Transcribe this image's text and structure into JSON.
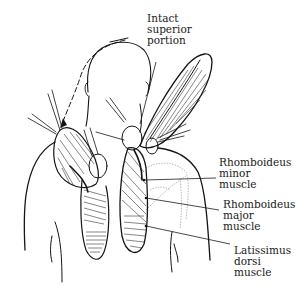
{
  "figure": {
    "colors": {
      "ink": "#151515",
      "background": "#ffffff",
      "faint_outline": "#8a8a8a"
    }
  },
  "labels": {
    "intact_superior_portion": {
      "lines": [
        "Intact",
        "superior",
        "portion"
      ]
    },
    "rhomboideus_minor": {
      "lines": [
        "Rhomboideus",
        "minor",
        "muscle"
      ]
    },
    "rhomboideus_major": {
      "lines": [
        "Rhomboideus",
        "major",
        "muscle"
      ]
    },
    "latissimus_dorsi": {
      "lines": [
        "Latissimus",
        "dorsi",
        "muscle"
      ]
    }
  }
}
